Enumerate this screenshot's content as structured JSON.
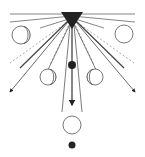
{
  "diagram": {
    "type": "radial-ray-diagram",
    "colors": {
      "background": "#ffffff",
      "stroke": "#555555",
      "dark": "#222222"
    },
    "source": {
      "shape": "inverted-triangle",
      "x": 72,
      "y": 19
    },
    "rays": {
      "solid_count": 8,
      "dashed_count": 4,
      "arrowheads": [
        "down-left",
        "down",
        "down-right"
      ]
    },
    "circles": [
      {
        "label": "moon-phase-upper-left",
        "cx": 21,
        "cy": 35,
        "r": 9
      },
      {
        "label": "moon-phase-upper-right",
        "cx": 124,
        "cy": 34,
        "r": 9
      },
      {
        "label": "moon-phase-lower-left",
        "cx": 48,
        "cy": 77,
        "r": 8
      },
      {
        "label": "moon-phase-lower-right",
        "cx": 95,
        "cy": 77,
        "r": 8
      },
      {
        "label": "open-circle-bottom",
        "cx": 72,
        "cy": 125,
        "r": 9
      }
    ],
    "dots": [
      {
        "label": "dot-middle",
        "cx": 72,
        "cy": 65,
        "r": 4
      },
      {
        "label": "dot-bottom",
        "cx": 72,
        "cy": 145,
        "r": 3.5
      }
    ]
  }
}
